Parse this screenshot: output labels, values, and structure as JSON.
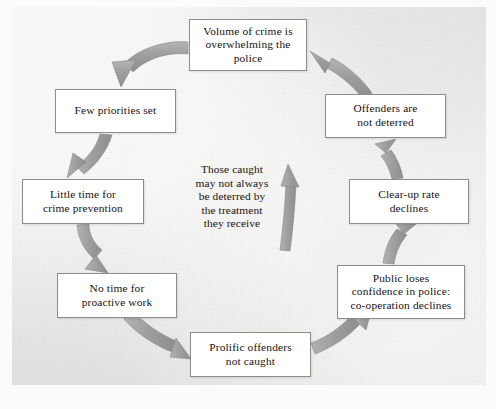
{
  "diagram": {
    "background_color": "#e7e7e5",
    "box_fill_color": "#ffffff",
    "box_border_color": "#8c8c8c",
    "arrow_color": "#9c9c9c",
    "text_color": "#17120f",
    "flow_direction": "counter-clockwise",
    "nodes": [
      {
        "id": "volume-of-crime",
        "label": "Volume of crime is\noverwhelming the\npolice",
        "x": 189,
        "y": 19,
        "w": 118,
        "h": 52
      },
      {
        "id": "few-priorities-set",
        "label": "Few priorities set",
        "x": 55,
        "y": 89,
        "w": 121,
        "h": 44
      },
      {
        "id": "little-time-for-crime-prevention",
        "label": "Little time for\ncrime prevention",
        "x": 22,
        "y": 179,
        "w": 122,
        "h": 45
      },
      {
        "id": "no-time-for-proactive-work",
        "label": "No time for\nproactive work",
        "x": 57,
        "y": 273,
        "w": 120,
        "h": 45
      },
      {
        "id": "prolific-offenders-not-caught",
        "label": "Prolific offenders\nnot caught",
        "x": 190,
        "y": 332,
        "w": 121,
        "h": 45
      },
      {
        "id": "public-loses-confidence",
        "label": "Public loses\nconfidence in police:\nco-operation declines",
        "x": 337,
        "y": 265,
        "w": 128,
        "h": 54
      },
      {
        "id": "clear-up-rate-declines",
        "label": "Clear-up rate\ndeclines",
        "x": 349,
        "y": 179,
        "w": 120,
        "h": 45
      },
      {
        "id": "offenders-are-not-deterred",
        "label": "Offenders are\nnot deterred",
        "x": 325,
        "y": 94,
        "w": 121,
        "h": 44
      }
    ],
    "center_note": {
      "id": "center-note",
      "label": "Those caught\nmay not always\nbe deterred by\nthe treatment\nthey receive",
      "x": 184,
      "y": 163,
      "w": 96,
      "h": 70
    },
    "arrows": [
      {
        "id": "arrow-volume-to-few-priorities",
        "from": "volume-of-crime",
        "to": "few-priorities-set"
      },
      {
        "id": "arrow-few-priorities-to-little-time",
        "from": "few-priorities-set",
        "to": "little-time-for-crime-prevention"
      },
      {
        "id": "arrow-little-time-to-no-time",
        "from": "little-time-for-crime-prevention",
        "to": "no-time-for-proactive-work"
      },
      {
        "id": "arrow-no-time-to-prolific",
        "from": "no-time-for-proactive-work",
        "to": "prolific-offenders-not-caught"
      },
      {
        "id": "arrow-prolific-to-public-loses",
        "from": "prolific-offenders-not-caught",
        "to": "public-loses-confidence"
      },
      {
        "id": "arrow-public-loses-to-clear-up",
        "from": "public-loses-confidence",
        "to": "clear-up-rate-declines"
      },
      {
        "id": "arrow-clear-up-to-offenders",
        "from": "clear-up-rate-declines",
        "to": "offenders-are-not-deterred"
      },
      {
        "id": "arrow-offenders-to-volume",
        "from": "offenders-are-not-deterred",
        "to": "volume-of-crime"
      },
      {
        "id": "arrow-center-note-up",
        "from": "center-note",
        "to": "volume-of-crime"
      }
    ]
  },
  "caption": {
    "text": ""
  }
}
